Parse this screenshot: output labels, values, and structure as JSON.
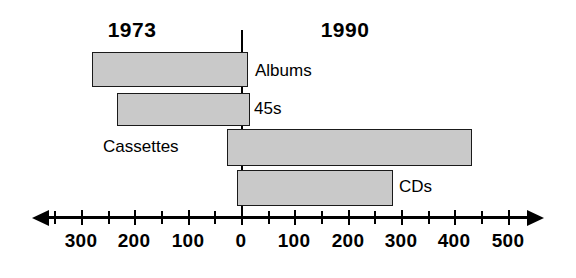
{
  "chart_data": {
    "type": "bar",
    "orientation": "horizontal",
    "title": "",
    "xlabel": "",
    "ylabel": "",
    "grid": false,
    "legend_position": "inline-era-headings",
    "era_headings": [
      {
        "label": "1973",
        "side": "left"
      },
      {
        "label": "1990",
        "side": "right"
      }
    ],
    "categories": [
      "Albums",
      "45s",
      "Cassettes",
      "CDs"
    ],
    "series": [
      {
        "name": "1973",
        "values": [
          -280,
          -233,
          -26,
          -7
        ]
      },
      {
        "name": "1990",
        "values": [
          13,
          17,
          433,
          285
        ]
      }
    ],
    "bars": [
      {
        "category": "Albums",
        "start": -280,
        "end": 13
      },
      {
        "category": "45s",
        "start": -233,
        "end": 17
      },
      {
        "category": "Cassettes",
        "start": -26,
        "end": 433
      },
      {
        "category": "CDs",
        "start": -7,
        "end": 285
      }
    ],
    "xlim": [
      -360,
      560
    ],
    "x_ticks_major": [
      -300,
      -200,
      -100,
      0,
      100,
      200,
      300,
      400,
      500
    ],
    "x_tick_labels": [
      "300",
      "200",
      "100",
      "0",
      "100",
      "200",
      "300",
      "400",
      "500"
    ],
    "x_ticks_minor": [
      -350,
      -250,
      -150,
      -50,
      50,
      150,
      250,
      350,
      450
    ],
    "colors": {
      "bar_fill": "#c9c9c9",
      "bar_stroke": "#1a1a1a",
      "axis": "#000000",
      "text": "#000000",
      "background": "#ffffff"
    }
  },
  "labels": {
    "albums": "Albums",
    "forty_fives": "45s",
    "cassettes": "Cassettes",
    "cds": "CDs"
  },
  "ticks": {
    "t_m300": "300",
    "t_m200": "200",
    "t_m100": "100",
    "t_0": "0",
    "t_p100": "100",
    "t_p200": "200",
    "t_p300": "300",
    "t_p400": "400",
    "t_p500": "500"
  },
  "eras": {
    "left": "1973",
    "right": "1990"
  }
}
